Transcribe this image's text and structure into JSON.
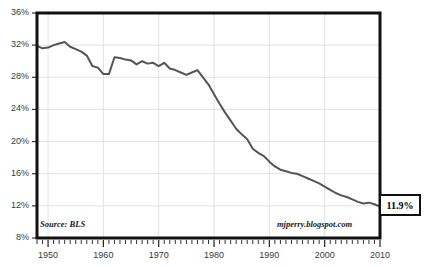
{
  "chart_data": {
    "type": "line",
    "title": "",
    "subtitle": "",
    "xlabel": "",
    "ylabel": "",
    "xlim": [
      1948,
      2010
    ],
    "ylim": [
      8,
      36
    ],
    "grid": true,
    "legend": "none",
    "y_ticks": [
      "8%",
      "12%",
      "16%",
      "20%",
      "24%",
      "28%",
      "32%",
      "36%"
    ],
    "y_tick_values": [
      8,
      12,
      16,
      20,
      24,
      28,
      32,
      36
    ],
    "x_ticks": [
      "1950",
      "1960",
      "1970",
      "1980",
      "1990",
      "2000",
      "2010"
    ],
    "x_tick_values": [
      1950,
      1960,
      1970,
      1980,
      1990,
      2000,
      2010
    ],
    "x_minor_tick_interval": 1,
    "series": [
      {
        "name": "Manufacturing share of employment",
        "color": "#555555",
        "x": [
          1948,
          1949,
          1950,
          1951,
          1952,
          1953,
          1954,
          1955,
          1956,
          1957,
          1958,
          1959,
          1960,
          1961,
          1962,
          1963,
          1964,
          1965,
          1966,
          1967,
          1968,
          1969,
          1970,
          1971,
          1972,
          1973,
          1974,
          1975,
          1976,
          1977,
          1978,
          1979,
          1980,
          1981,
          1982,
          1983,
          1984,
          1985,
          1986,
          1987,
          1988,
          1989,
          1990,
          1991,
          1992,
          1993,
          1994,
          1995,
          1996,
          1997,
          1998,
          1999,
          2000,
          2001,
          2002,
          2003,
          2004,
          2005,
          2006,
          2007,
          2008,
          2009,
          2010
        ],
        "values": [
          31.9,
          31.6,
          31.7,
          32.0,
          32.2,
          32.4,
          31.8,
          31.5,
          31.2,
          30.7,
          29.4,
          29.2,
          28.4,
          28.4,
          30.5,
          30.4,
          30.2,
          30.1,
          29.6,
          30.0,
          29.7,
          29.8,
          29.4,
          29.8,
          29.1,
          28.9,
          28.6,
          28.3,
          28.6,
          28.9,
          28.0,
          27.1,
          25.9,
          24.7,
          23.6,
          22.6,
          21.6,
          20.9,
          20.3,
          19.1,
          18.6,
          18.2,
          17.5,
          16.9,
          16.5,
          16.3,
          16.1,
          16.0,
          15.7,
          15.4,
          15.1,
          14.8,
          14.4,
          14.0,
          13.6,
          13.3,
          13.1,
          12.8,
          12.5,
          12.3,
          12.4,
          12.2,
          11.9
        ]
      }
    ],
    "annotations": [
      {
        "name": "end-value-callout",
        "text": "11.9%",
        "value": 11.9,
        "year": 2010
      },
      {
        "name": "source-note",
        "text": "Source: BLS"
      },
      {
        "name": "watermark",
        "text": "mjperry.blogspot.com"
      }
    ],
    "colors": {
      "line": "#555555",
      "frame": "#111111",
      "grid": "#e2e2e2",
      "background": "#ffffff",
      "tick_label": "#3a3a3a"
    }
  }
}
